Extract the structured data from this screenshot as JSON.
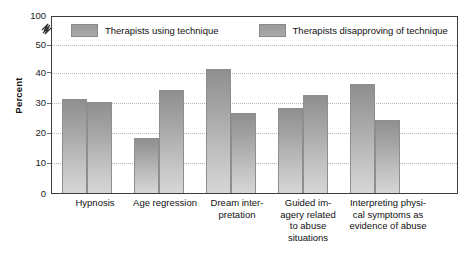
{
  "chart_data": {
    "type": "bar",
    "title": "",
    "xlabel": "",
    "ylabel": "Percent",
    "ylim": [
      0,
      50
    ],
    "y_axis_broken": true,
    "y_ticks": [
      0,
      10,
      20,
      30,
      40,
      50,
      100
    ],
    "grid": true,
    "legend_position": "top-inside",
    "categories": [
      "Hypnosis",
      "Age regression",
      "Dream inter-\npretation",
      "Guided im-\nagery related\nto abuse\nsituations",
      "Interpreting physi-\ncal symptoms as\nevidence of abuse"
    ],
    "series": [
      {
        "name": "Therapists using technique",
        "values": [
          31,
          18,
          41,
          28,
          36
        ]
      },
      {
        "name": "Therapists disapproving of technique",
        "values": [
          30,
          34,
          26.5,
          32.5,
          24
        ]
      }
    ],
    "colors": {
      "series_fill_top": "#8f8f8f",
      "series_fill_bottom": "#d6d6d6",
      "bar_border": "#8e8e8e",
      "axis": "#3c3c3c",
      "gridline": "#b9b9b9",
      "text": "#111111"
    }
  },
  "axis": {
    "y_title": "Percent",
    "ticks": [
      {
        "label": "100"
      },
      {
        "label": "50"
      },
      {
        "label": "40"
      },
      {
        "label": "30"
      },
      {
        "label": "20"
      },
      {
        "label": "10"
      },
      {
        "label": "0"
      }
    ]
  },
  "legend": {
    "items": [
      {
        "label": "Therapists using technique"
      },
      {
        "label": "Therapists disapproving of technique"
      }
    ]
  },
  "x_labels": [
    {
      "lines": [
        "Hypnosis"
      ]
    },
    {
      "lines": [
        "Age regression"
      ]
    },
    {
      "lines": [
        "Dream inter-",
        "pretation"
      ]
    },
    {
      "lines": [
        "Guided im-",
        "agery related",
        "to abuse",
        "situations"
      ]
    },
    {
      "lines": [
        "Interpreting physi-",
        "cal symptoms as",
        "evidence of abuse"
      ]
    }
  ]
}
